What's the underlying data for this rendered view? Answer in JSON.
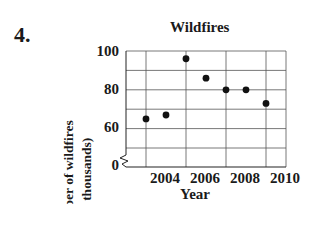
{
  "problem": {
    "number": "4."
  },
  "chart_data": {
    "type": "scatter",
    "title": "Wildfires",
    "xlabel": "Year",
    "ylabel": "Number of wildfires (in thousands)",
    "ylabel_lines": [
      "Number of wildfires",
      "(in thousands)"
    ],
    "x": [
      2004,
      2005,
      2006,
      2007,
      2008,
      2009,
      2010
    ],
    "y": [
      65,
      67,
      96,
      86,
      80,
      80,
      73
    ],
    "xticks": [
      "2004",
      "2006",
      "2008",
      "2010"
    ],
    "yticks": [
      "0",
      "60",
      "80",
      "100"
    ],
    "ylim": [
      0,
      100
    ],
    "y_axis_break": true,
    "grid": true,
    "legend": null,
    "point_color": "#111111",
    "grid_color": "#555555"
  }
}
